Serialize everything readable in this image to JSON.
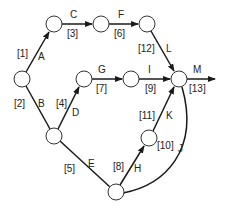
{
  "diagram": {
    "type": "activity-on-arrow network",
    "nodes": [
      {
        "id": "n1",
        "x": 22,
        "y": 79
      },
      {
        "id": "n2",
        "x": 54,
        "y": 24
      },
      {
        "id": "n3",
        "x": 101,
        "y": 24
      },
      {
        "id": "n4",
        "x": 147,
        "y": 24
      },
      {
        "id": "n5",
        "x": 54,
        "y": 136
      },
      {
        "id": "n6",
        "x": 84,
        "y": 79
      },
      {
        "id": "n7",
        "x": 131,
        "y": 79
      },
      {
        "id": "n8",
        "x": 179,
        "y": 79
      },
      {
        "id": "n9",
        "x": 149,
        "y": 138
      },
      {
        "id": "n10",
        "x": 116,
        "y": 192
      }
    ],
    "edges": [
      {
        "activity": "A",
        "duration": "[1]",
        "from": "n1",
        "to": "n2"
      },
      {
        "activity": "B",
        "duration": "[2]",
        "from": "n1",
        "to": "n5"
      },
      {
        "activity": "C",
        "duration": "[3]",
        "from": "n2",
        "to": "n3"
      },
      {
        "activity": "D",
        "duration": "[4]",
        "from": "n5",
        "to": "n6"
      },
      {
        "activity": "E",
        "duration": "[5]",
        "from": "n5",
        "to": "n10"
      },
      {
        "activity": "F",
        "duration": "[6]",
        "from": "n3",
        "to": "n4"
      },
      {
        "activity": "G",
        "duration": "[7]",
        "from": "n6",
        "to": "n7"
      },
      {
        "activity": "H",
        "duration": "[8]",
        "from": "n10",
        "to": "n9"
      },
      {
        "activity": "I",
        "duration": "[9]",
        "from": "n7",
        "to": "n8"
      },
      {
        "activity": "J",
        "duration": "[10]",
        "from": "n10",
        "to": "n8"
      },
      {
        "activity": "K",
        "duration": "[11]",
        "from": "n9",
        "to": "n8"
      },
      {
        "activity": "L",
        "duration": "[12]",
        "from": "n4",
        "to": "n8"
      },
      {
        "activity": "M",
        "duration": "[13]",
        "from": "n8",
        "to": "end"
      }
    ]
  },
  "labels": {
    "A": "A",
    "B": "B",
    "C": "C",
    "D": "D",
    "E": "E",
    "F": "F",
    "G": "G",
    "H": "H",
    "I": "I",
    "J": "J",
    "K": "K",
    "L": "L",
    "M": "M",
    "d1": "[1]",
    "d2": "[2]",
    "d3": "[3]",
    "d4": "[4]",
    "d5": "[5]",
    "d6": "[6]",
    "d7": "[7]",
    "d8": "[8]",
    "d9": "[9]",
    "d10": "[10]",
    "d11": "[11]",
    "d12": "[12]",
    "d13": "[13]"
  }
}
